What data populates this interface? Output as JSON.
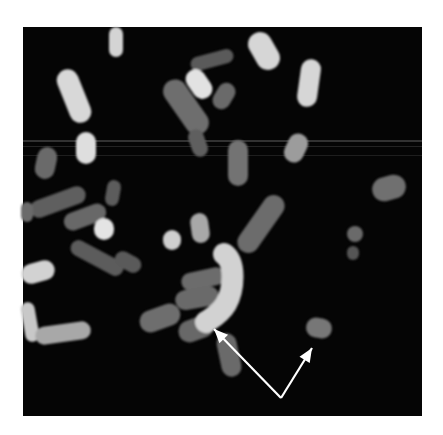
{
  "figure": {
    "background_color": "#ffffff",
    "panel": {
      "x": 23,
      "y": 27,
      "width": 399,
      "height": 389,
      "color": "#050505"
    },
    "scan_lines": [
      {
        "y": 140,
        "height": 2,
        "opacity": 0.18
      },
      {
        "y": 146,
        "height": 1,
        "opacity": 0.12
      },
      {
        "y": 155,
        "height": 1,
        "opacity": 0.1
      }
    ],
    "chromosomes": [
      {
        "id": "c1",
        "cx": 116,
        "cy": 42,
        "w": 14,
        "h": 30,
        "rot": 0,
        "gray": "#d4d4d4"
      },
      {
        "id": "c2",
        "cx": 74,
        "cy": 96,
        "w": 22,
        "h": 56,
        "rot": -22,
        "gray": "#d8d8d8"
      },
      {
        "id": "c3",
        "cx": 86,
        "cy": 148,
        "w": 20,
        "h": 32,
        "rot": 0,
        "gray": "#dedede"
      },
      {
        "id": "c4",
        "cx": 46,
        "cy": 163,
        "w": 20,
        "h": 32,
        "rot": 12,
        "gray": "#6a6a6a"
      },
      {
        "id": "c5",
        "cx": 212,
        "cy": 60,
        "w": 14,
        "h": 44,
        "rot": 75,
        "gray": "#5a5a5a"
      },
      {
        "id": "c6",
        "cx": 199,
        "cy": 84,
        "w": 20,
        "h": 32,
        "rot": -35,
        "gray": "#e2e2e2"
      },
      {
        "id": "c7",
        "cx": 186,
        "cy": 107,
        "w": 24,
        "h": 62,
        "rot": -35,
        "gray": "#6e6e6e"
      },
      {
        "id": "c8",
        "cx": 224,
        "cy": 96,
        "w": 18,
        "h": 28,
        "rot": 30,
        "gray": "#6a6a6a"
      },
      {
        "id": "c9",
        "cx": 264,
        "cy": 51,
        "w": 24,
        "h": 40,
        "rot": -30,
        "gray": "#d6d6d6"
      },
      {
        "id": "c10",
        "cx": 309,
        "cy": 83,
        "w": 20,
        "h": 48,
        "rot": 8,
        "gray": "#d6d6d6"
      },
      {
        "id": "c11",
        "cx": 198,
        "cy": 143,
        "w": 16,
        "h": 28,
        "rot": -20,
        "gray": "#5e5e5e"
      },
      {
        "id": "c12",
        "cx": 238,
        "cy": 163,
        "w": 20,
        "h": 46,
        "rot": 0,
        "gray": "#737373"
      },
      {
        "id": "c13",
        "cx": 296,
        "cy": 148,
        "w": 20,
        "h": 30,
        "rot": 25,
        "gray": "#9c9c9c"
      },
      {
        "id": "c14",
        "cx": 389,
        "cy": 188,
        "w": 34,
        "h": 24,
        "rot": -15,
        "gray": "#707070"
      },
      {
        "id": "c15",
        "cx": 113,
        "cy": 193,
        "w": 14,
        "h": 26,
        "rot": 10,
        "gray": "#5c5c5c"
      },
      {
        "id": "c16",
        "cx": 58,
        "cy": 202,
        "w": 18,
        "h": 58,
        "rot": 70,
        "gray": "#5e5e5e"
      },
      {
        "id": "c17",
        "cx": 85,
        "cy": 217,
        "w": 18,
        "h": 44,
        "rot": 70,
        "gray": "#676767"
      },
      {
        "id": "c18",
        "cx": 104,
        "cy": 229,
        "w": 20,
        "h": 22,
        "rot": 0,
        "gray": "#e4e4e4"
      },
      {
        "id": "c19",
        "cx": 27,
        "cy": 212,
        "w": 12,
        "h": 20,
        "rot": 0,
        "gray": "#6a6a6a"
      },
      {
        "id": "c20",
        "cx": 97,
        "cy": 258,
        "w": 16,
        "h": 58,
        "rot": -62,
        "gray": "#5c5c5c"
      },
      {
        "id": "c21",
        "cx": 128,
        "cy": 262,
        "w": 16,
        "h": 28,
        "rot": -62,
        "gray": "#5a5a5a"
      },
      {
        "id": "c22",
        "cx": 38,
        "cy": 272,
        "w": 20,
        "h": 34,
        "rot": 75,
        "gray": "#d2d2d2"
      },
      {
        "id": "c23",
        "cx": 30,
        "cy": 322,
        "w": 14,
        "h": 40,
        "rot": -10,
        "gray": "#c8c8c8"
      },
      {
        "id": "c24",
        "cx": 63,
        "cy": 333,
        "w": 18,
        "h": 56,
        "rot": 82,
        "gray": "#a8a8a8"
      },
      {
        "id": "c25",
        "cx": 172,
        "cy": 240,
        "w": 18,
        "h": 20,
        "rot": 0,
        "gray": "#cfcfcf"
      },
      {
        "id": "c26",
        "cx": 200,
        "cy": 228,
        "w": 18,
        "h": 30,
        "rot": -8,
        "gray": "#a8a8a8"
      },
      {
        "id": "c27",
        "cx": 261,
        "cy": 224,
        "w": 22,
        "h": 66,
        "rot": 35,
        "gray": "#6c6c6c"
      },
      {
        "id": "c28",
        "cx": 355,
        "cy": 234,
        "w": 16,
        "h": 16,
        "rot": 0,
        "gray": "#6a6a6a"
      },
      {
        "id": "c29",
        "cx": 353,
        "cy": 253,
        "w": 12,
        "h": 14,
        "rot": 0,
        "gray": "#555555"
      },
      {
        "id": "c30",
        "cx": 203,
        "cy": 279,
        "w": 18,
        "h": 44,
        "rot": 78,
        "gray": "#6c6c6c"
      },
      {
        "id": "c31",
        "cx": 197,
        "cy": 298,
        "w": 20,
        "h": 44,
        "rot": 80,
        "gray": "#6a6a6a"
      },
      {
        "id": "c32",
        "cx": 160,
        "cy": 318,
        "w": 22,
        "h": 42,
        "rot": 70,
        "gray": "#6e6e6e"
      },
      {
        "id": "c33",
        "cx": 196,
        "cy": 329,
        "w": 22,
        "h": 36,
        "rot": 70,
        "gray": "#686868"
      },
      {
        "id": "c34",
        "cx": 229,
        "cy": 355,
        "w": 20,
        "h": 44,
        "rot": -12,
        "gray": "#6a6a6a"
      },
      {
        "id": "c35",
        "cx": 319,
        "cy": 328,
        "w": 26,
        "h": 20,
        "rot": 10,
        "gray": "#777777"
      }
    ],
    "curved_chromosome": {
      "id": "c36",
      "path": "M 224 254 C 236 262, 234 290, 226 304 C 220 314, 212 318, 206 322",
      "width": 22,
      "gray": "#d2d2d2"
    },
    "arrows": {
      "color": "#ffffff",
      "vertex": {
        "x": 281,
        "y": 398
      },
      "tips": [
        {
          "label": "left-arrow",
          "x": 214,
          "y": 329
        },
        {
          "label": "right-arrow",
          "x": 312,
          "y": 348
        }
      ]
    }
  }
}
